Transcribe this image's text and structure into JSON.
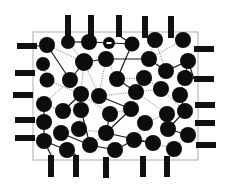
{
  "diagram": {
    "title": "",
    "colors": {
      "background": "#ffffff",
      "frame": "#9a9a9a",
      "node": "#0d0d0d",
      "electrode": "#111111",
      "solid_link": "#1a1a1a",
      "dotted_link": "#8a8a8a"
    },
    "frame": {
      "x": 33,
      "y": 32,
      "width": 165,
      "height": 128
    },
    "electrodes": {
      "top": [
        {
          "x": 65,
          "y": 15,
          "w": 6,
          "h": 22
        },
        {
          "x": 88,
          "y": 15,
          "w": 6,
          "h": 22
        },
        {
          "x": 116,
          "y": 15,
          "w": 6,
          "h": 22
        },
        {
          "x": 142,
          "y": 16,
          "w": 6,
          "h": 22
        },
        {
          "x": 168,
          "y": 16,
          "w": 6,
          "h": 22
        }
      ],
      "bottom": [
        {
          "x": 48,
          "y": 155,
          "w": 6,
          "h": 22
        },
        {
          "x": 73,
          "y": 155,
          "w": 6,
          "h": 22
        },
        {
          "x": 103,
          "y": 157,
          "w": 6,
          "h": 21
        },
        {
          "x": 140,
          "y": 156,
          "w": 6,
          "h": 21
        },
        {
          "x": 164,
          "y": 156,
          "w": 6,
          "h": 21
        }
      ],
      "left": [
        {
          "x": 17,
          "y": 43,
          "w": 20,
          "h": 6
        },
        {
          "x": 15,
          "y": 70,
          "w": 20,
          "h": 6
        },
        {
          "x": 13,
          "y": 92,
          "w": 20,
          "h": 6
        },
        {
          "x": 15,
          "y": 117,
          "w": 20,
          "h": 6
        },
        {
          "x": 15,
          "y": 135,
          "w": 20,
          "h": 6
        }
      ],
      "right": [
        {
          "x": 194,
          "y": 46,
          "w": 20,
          "h": 6
        },
        {
          "x": 194,
          "y": 76,
          "w": 20,
          "h": 6
        },
        {
          "x": 195,
          "y": 102,
          "w": 20,
          "h": 6
        },
        {
          "x": 195,
          "y": 120,
          "w": 20,
          "h": 6
        },
        {
          "x": 196,
          "y": 142,
          "w": 20,
          "h": 6
        }
      ]
    },
    "nodes": [
      {
        "id": 0,
        "x": 47,
        "y": 45,
        "r": 8
      },
      {
        "id": 1,
        "x": 68,
        "y": 42,
        "r": 7
      },
      {
        "id": 2,
        "x": 89,
        "y": 42,
        "r": 8
      },
      {
        "id": 3,
        "x": 109,
        "y": 43,
        "r": 6,
        "marked": true
      },
      {
        "id": 4,
        "x": 132,
        "y": 44,
        "r": 7.5
      },
      {
        "id": 5,
        "x": 155,
        "y": 40,
        "r": 8
      },
      {
        "id": 6,
        "x": 183,
        "y": 40,
        "r": 8
      },
      {
        "id": 7,
        "x": 43,
        "y": 64,
        "r": 7
      },
      {
        "id": 8,
        "x": 84,
        "y": 62,
        "r": 9
      },
      {
        "id": 9,
        "x": 106,
        "y": 59,
        "r": 8
      },
      {
        "id": 10,
        "x": 149,
        "y": 59,
        "r": 8
      },
      {
        "id": 11,
        "x": 166,
        "y": 71,
        "r": 8
      },
      {
        "id": 12,
        "x": 188,
        "y": 61,
        "r": 8
      },
      {
        "id": 13,
        "x": 47,
        "y": 80,
        "r": 7.5
      },
      {
        "id": 14,
        "x": 70,
        "y": 80,
        "r": 8
      },
      {
        "id": 15,
        "x": 117,
        "y": 79,
        "r": 8
      },
      {
        "id": 16,
        "x": 144,
        "y": 78,
        "r": 8
      },
      {
        "id": 17,
        "x": 185,
        "y": 78,
        "r": 8
      },
      {
        "id": 18,
        "x": 81,
        "y": 94,
        "r": 8
      },
      {
        "id": 19,
        "x": 99,
        "y": 96,
        "r": 8
      },
      {
        "id": 20,
        "x": 136,
        "y": 92,
        "r": 8
      },
      {
        "id": 21,
        "x": 161,
        "y": 89,
        "r": 8
      },
      {
        "id": 22,
        "x": 180,
        "y": 95,
        "r": 8
      },
      {
        "id": 23,
        "x": 44,
        "y": 104,
        "r": 8
      },
      {
        "id": 24,
        "x": 63,
        "y": 111,
        "r": 8
      },
      {
        "id": 25,
        "x": 81,
        "y": 110,
        "r": 8
      },
      {
        "id": 26,
        "x": 110,
        "y": 114,
        "r": 8
      },
      {
        "id": 27,
        "x": 131,
        "y": 109,
        "r": 8
      },
      {
        "id": 28,
        "x": 167,
        "y": 114,
        "r": 8
      },
      {
        "id": 29,
        "x": 185,
        "y": 111,
        "r": 8
      },
      {
        "id": 30,
        "x": 44,
        "y": 122,
        "r": 8
      },
      {
        "id": 31,
        "x": 79,
        "y": 129,
        "r": 8
      },
      {
        "id": 32,
        "x": 145,
        "y": 123,
        "r": 8
      },
      {
        "id": 33,
        "x": 168,
        "y": 129,
        "r": 8
      },
      {
        "id": 34,
        "x": 188,
        "y": 135,
        "r": 8
      },
      {
        "id": 35,
        "x": 61,
        "y": 133,
        "r": 8
      },
      {
        "id": 36,
        "x": 106,
        "y": 133,
        "r": 8
      },
      {
        "id": 37,
        "x": 134,
        "y": 140,
        "r": 8
      },
      {
        "id": 38,
        "x": 44,
        "y": 141,
        "r": 8
      },
      {
        "id": 39,
        "x": 67,
        "y": 150,
        "r": 8
      },
      {
        "id": 40,
        "x": 90,
        "y": 145,
        "r": 8
      },
      {
        "id": 41,
        "x": 115,
        "y": 150,
        "r": 8
      },
      {
        "id": 42,
        "x": 153,
        "y": 143,
        "r": 8
      },
      {
        "id": 43,
        "x": 174,
        "y": 149,
        "r": 8
      }
    ],
    "solid_links": [
      [
        0,
        14
      ],
      [
        1,
        2
      ],
      [
        2,
        3
      ],
      [
        3,
        4
      ],
      [
        8,
        9
      ],
      [
        9,
        10
      ],
      [
        8,
        14
      ],
      [
        4,
        15
      ],
      [
        10,
        11
      ],
      [
        11,
        12
      ],
      [
        12,
        17
      ],
      [
        15,
        20
      ],
      [
        18,
        24
      ],
      [
        19,
        27
      ],
      [
        25,
        40
      ],
      [
        26,
        36
      ],
      [
        27,
        36
      ],
      [
        36,
        42
      ],
      [
        35,
        40
      ],
      [
        40,
        41
      ],
      [
        29,
        33
      ],
      [
        28,
        33
      ],
      [
        33,
        34
      ],
      [
        38,
        39
      ],
      [
        23,
        30
      ],
      [
        30,
        38
      ],
      [
        37,
        42
      ],
      [
        22,
        29
      ],
      [
        41,
        37
      ]
    ],
    "dotted_links": [
      [
        0,
        8
      ],
      [
        1,
        8
      ],
      [
        5,
        10
      ],
      [
        6,
        10
      ],
      [
        5,
        11
      ],
      [
        7,
        13
      ],
      [
        13,
        18
      ],
      [
        8,
        18
      ],
      [
        8,
        19
      ],
      [
        9,
        15
      ],
      [
        15,
        16
      ],
      [
        16,
        21
      ],
      [
        21,
        20
      ],
      [
        20,
        28
      ],
      [
        21,
        29
      ],
      [
        23,
        24
      ],
      [
        24,
        25
      ],
      [
        25,
        31
      ],
      [
        31,
        35
      ],
      [
        19,
        20
      ],
      [
        26,
        27
      ],
      [
        28,
        32
      ],
      [
        32,
        37
      ],
      [
        34,
        43
      ],
      [
        12,
        11
      ],
      [
        14,
        23
      ],
      [
        17,
        22
      ],
      [
        9,
        19
      ],
      [
        36,
        40
      ],
      [
        26,
        18
      ],
      [
        42,
        43
      ],
      [
        31,
        36
      ]
    ],
    "electrode_links": [
      {
        "from": [
          68,
          37
        ],
        "to": 1
      },
      {
        "from": [
          121,
          37
        ],
        "to": 4
      },
      {
        "from": [
          145,
          37
        ],
        "to": 5
      },
      {
        "from": [
          51,
          155
        ],
        "to": 38
      },
      {
        "from": [
          76,
          155
        ],
        "to": 39
      },
      {
        "from": [
          37,
          46
        ],
        "to": 0
      },
      {
        "from": [
          194,
          79
        ],
        "to": 12
      }
    ]
  }
}
